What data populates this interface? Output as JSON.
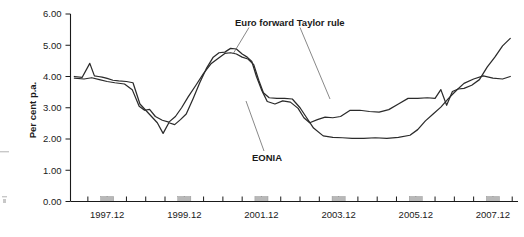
{
  "chart_data": {
    "type": "line",
    "title": "",
    "xlabel": "",
    "ylabel": "Per cent p.a.",
    "ylim": [
      0,
      6
    ],
    "xlim": [
      1997.0,
      2008.6
    ],
    "grid": false,
    "legend_position": "inline-annotations",
    "ytick_labels": [
      "0.00",
      "1.00",
      "2.00",
      "3.00",
      "4.00",
      "5.00",
      "6.00"
    ],
    "ytick_values": [
      0,
      1,
      2,
      3,
      4,
      5,
      6
    ],
    "xtick_labels": [
      "1997.12",
      "1999.12",
      "2001.12",
      "2003.12",
      "2005.12",
      "2007.12"
    ],
    "xtick_values": [
      1997.95,
      1999.95,
      2001.95,
      2003.95,
      2005.95,
      2007.95
    ],
    "annotations": [
      {
        "name": "euro-forward-taylor-rule-label",
        "text": "Euro forward Taylor rule"
      },
      {
        "name": "eonia-label",
        "text": "EONIA"
      }
    ],
    "series": [
      {
        "name": "Euro forward Taylor rule",
        "x": [
          1997.1,
          1997.3,
          1997.5,
          1997.62,
          1997.72,
          1997.82,
          1997.95,
          1998.1,
          1998.25,
          1998.45,
          1998.62,
          1998.8,
          1998.95,
          1999.1,
          1999.25,
          1999.4,
          1999.55,
          1999.7,
          1999.85,
          2000.0,
          2000.18,
          2000.35,
          2000.52,
          2000.7,
          2000.85,
          2001.0,
          2001.15,
          2001.3,
          2001.45,
          2001.58,
          2001.7,
          2001.82,
          2001.95,
          2002.1,
          2002.3,
          2002.5,
          2002.7,
          2002.9,
          2003.05,
          2003.2,
          2003.4,
          2003.6,
          2003.8,
          2004.0,
          2004.25,
          2004.5,
          2004.75,
          2005.0,
          2005.25,
          2005.5,
          2005.75,
          2006.0,
          2006.25,
          2006.45,
          2006.6,
          2006.75,
          2006.9,
          2007.05,
          2007.2,
          2007.4,
          2007.6,
          2007.8,
          2008.0,
          2008.2,
          2008.4
        ],
        "y": [
          4.0,
          3.97,
          4.42,
          4.02,
          4.0,
          3.98,
          3.94,
          3.88,
          3.86,
          3.84,
          3.8,
          3.12,
          2.92,
          2.72,
          2.52,
          2.18,
          2.52,
          2.46,
          2.62,
          2.8,
          3.3,
          3.8,
          4.25,
          4.62,
          4.76,
          4.78,
          4.9,
          4.88,
          4.72,
          4.62,
          4.48,
          4.0,
          3.58,
          3.2,
          3.12,
          3.22,
          3.18,
          2.98,
          2.68,
          2.52,
          2.62,
          2.7,
          2.68,
          2.72,
          2.92,
          2.92,
          2.88,
          2.86,
          2.94,
          3.12,
          3.3,
          3.3,
          3.32,
          3.3,
          3.58,
          3.08,
          3.52,
          3.6,
          3.62,
          3.72,
          3.9,
          4.3,
          4.62,
          4.98,
          5.22
        ]
      },
      {
        "name": "EONIA",
        "x": [
          1997.1,
          1997.35,
          1997.55,
          1997.75,
          1997.95,
          1998.15,
          1998.4,
          1998.6,
          1998.78,
          1998.92,
          1999.05,
          1999.2,
          1999.38,
          1999.55,
          1999.72,
          1999.88,
          2000.05,
          2000.25,
          2000.45,
          2000.65,
          2000.85,
          2001.0,
          2001.15,
          2001.3,
          2001.45,
          2001.6,
          2001.75,
          2001.88,
          2002.0,
          2002.15,
          2002.35,
          2002.55,
          2002.75,
          2002.95,
          2003.1,
          2003.3,
          2003.55,
          2003.8,
          2004.05,
          2004.3,
          2004.6,
          2004.9,
          2005.2,
          2005.5,
          2005.8,
          2006.0,
          2006.2,
          2006.4,
          2006.6,
          2006.8,
          2007.0,
          2007.2,
          2007.45,
          2007.7,
          2007.95,
          2008.2,
          2008.4
        ],
        "y": [
          3.95,
          3.92,
          3.96,
          3.9,
          3.84,
          3.8,
          3.76,
          3.58,
          3.05,
          2.92,
          2.95,
          2.72,
          2.6,
          2.54,
          2.72,
          3.0,
          3.35,
          3.72,
          4.1,
          4.42,
          4.6,
          4.74,
          4.76,
          4.72,
          4.62,
          4.56,
          4.38,
          3.88,
          3.48,
          3.32,
          3.3,
          3.3,
          3.28,
          3.0,
          2.72,
          2.35,
          2.1,
          2.05,
          2.04,
          2.02,
          2.02,
          2.04,
          2.02,
          2.05,
          2.12,
          2.3,
          2.58,
          2.8,
          3.02,
          3.3,
          3.55,
          3.78,
          3.92,
          4.02,
          3.95,
          3.92,
          4.0
        ]
      }
    ],
    "shaded_bands": [
      {
        "start": 1997.78,
        "end": 1998.12
      },
      {
        "start": 1999.78,
        "end": 2000.12
      },
      {
        "start": 2001.78,
        "end": 2002.12
      },
      {
        "start": 2003.78,
        "end": 2004.12
      },
      {
        "start": 2005.78,
        "end": 2006.12
      },
      {
        "start": 2007.78,
        "end": 2008.12
      }
    ]
  }
}
